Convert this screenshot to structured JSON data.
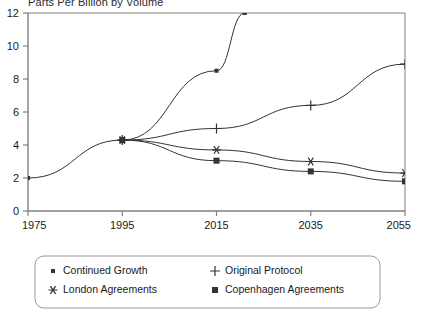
{
  "chart_data": {
    "type": "line",
    "title": "Parts Per Billion by Volume",
    "xlabel": "",
    "ylabel": "",
    "xlim": [
      1975,
      2055
    ],
    "ylim": [
      0,
      12
    ],
    "xticks": [
      "1975",
      "1995",
      "2015",
      "2035",
      "2055"
    ],
    "yticks": [
      "0",
      "2",
      "4",
      "6",
      "8",
      "10",
      "12"
    ],
    "grid": false,
    "legend_position": "bottom",
    "series": [
      {
        "name": "Continued Growth",
        "marker": "dot",
        "x": [
          1975,
          1995,
          2015,
          2021
        ],
        "values": [
          2.0,
          4.3,
          8.5,
          12.0
        ]
      },
      {
        "name": "Original Protocol",
        "marker": "plus",
        "x": [
          1995,
          2015,
          2035,
          2055
        ],
        "values": [
          4.3,
          5.0,
          6.4,
          8.9
        ]
      },
      {
        "name": "London Agreements",
        "marker": "asterisk",
        "x": [
          1995,
          2015,
          2035,
          2055
        ],
        "values": [
          4.3,
          3.7,
          3.0,
          2.3
        ]
      },
      {
        "name": "Copenhagen Agreements",
        "marker": "square",
        "x": [
          1995,
          2015,
          2035,
          2055
        ],
        "values": [
          4.3,
          3.05,
          2.4,
          1.8
        ]
      }
    ]
  },
  "legend": {
    "entries": [
      {
        "label": "Continued Growth",
        "marker": "dot"
      },
      {
        "label": "Original Protocol",
        "marker": "plus"
      },
      {
        "label": "London Agreements",
        "marker": "asterisk"
      },
      {
        "label": "Copenhagen Agreements",
        "marker": "square"
      }
    ]
  },
  "colors": {
    "line": "#333333",
    "axis": "#808080",
    "text": "#1a1a1a",
    "legend_border": "#999999"
  }
}
